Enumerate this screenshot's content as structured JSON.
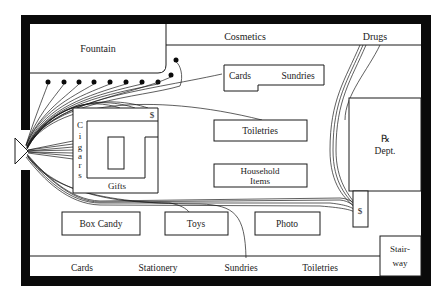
{
  "floor_plan": {
    "title": "Store floor plan with customer traffic paths",
    "colors": {
      "wall": "#0a0a0a",
      "line": "#1a1a1a",
      "background": "#ffffff",
      "text": "#222222"
    },
    "areas": {
      "fountain": "Fountain",
      "cosmetics": "Cosmetics",
      "drugs": "Drugs",
      "cards_sundries_cards": "Cards",
      "cards_sundries_sundries": "Sundries",
      "toiletries_island": "Toiletries",
      "rx_dept_symbol": "℞",
      "rx_dept_label": "Dept.",
      "household_line1": "Household",
      "household_line2": "Items",
      "cigars": [
        "C",
        "i",
        "g",
        "a",
        "r",
        "s"
      ],
      "gifts": "Gifts",
      "cashier_top": "$",
      "cashier_right": "$",
      "box_candy": "Box Candy",
      "toys": "Toys",
      "photo": "Photo",
      "stairway_line1": "Stair-",
      "stairway_line2": "way"
    },
    "bottom_wall_labels": [
      "Cards",
      "Stationery",
      "Sundries",
      "Toiletries"
    ],
    "entrance": {
      "label": "entrance-arrow",
      "direction": "right"
    },
    "fountain_stool_count": 10
  }
}
